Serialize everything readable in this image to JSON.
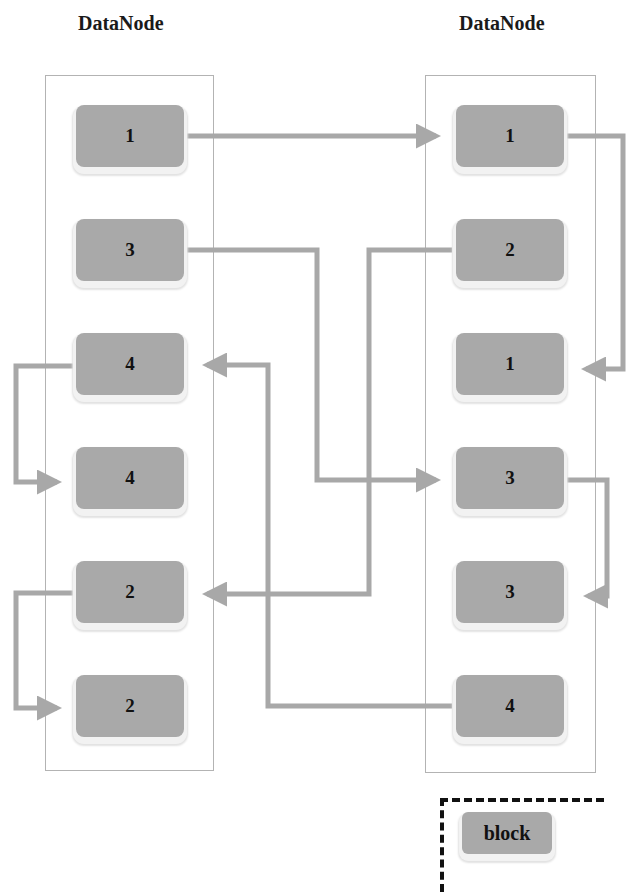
{
  "left_node": {
    "title": "DataNode",
    "blocks": [
      "1",
      "3",
      "4",
      "4",
      "2",
      "2"
    ]
  },
  "right_node": {
    "title": "DataNode",
    "blocks": [
      "1",
      "2",
      "1",
      "3",
      "3",
      "4"
    ]
  },
  "connections": [
    {
      "from": "left.block.1 (1)",
      "to": "right.block.1 (1)"
    },
    {
      "from": "right.block.1 (1)",
      "to": "right.block.3 (1)"
    },
    {
      "from": "left.block.2 (3)",
      "to": "right.block.4 (3)"
    },
    {
      "from": "right.block.4 (3)",
      "to": "right.block.5 (3)"
    },
    {
      "from": "right.block.2 (2)",
      "to": "left.block.5 (2)"
    },
    {
      "from": "left.block.5 (2)",
      "to": "left.block.6 (2)"
    },
    {
      "from": "right.block.6 (4)",
      "to": "left.block.3 (4)"
    },
    {
      "from": "left.block.3 (4)",
      "to": "left.block.4 (4)"
    }
  ],
  "legend": {
    "label": "block"
  },
  "colors": {
    "block_fill": "#a9a9a9",
    "arrow": "#a8a8a8",
    "node_border": "#b3b3b3"
  }
}
